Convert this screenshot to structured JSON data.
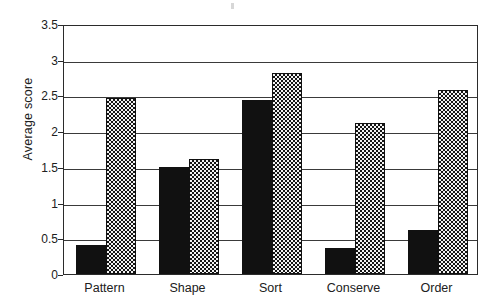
{
  "chart_data": {
    "type": "bar",
    "title": "",
    "xlabel": "",
    "ylabel": "Average score",
    "ylim": [
      0,
      3.5
    ],
    "ytick_values": [
      0,
      0.5,
      1,
      1.5,
      2,
      2.5,
      3,
      3.5
    ],
    "ytick_labels": [
      "0",
      "0.5",
      "1",
      "1.5",
      "2",
      "2.5",
      "3",
      "3.5"
    ],
    "grid": true,
    "grid_axis": "y",
    "legend": "none",
    "categories": [
      "Pattern",
      "Shape",
      "Sort",
      "Conserve",
      "Order"
    ],
    "series": [
      {
        "name": "Series 1",
        "fill": "solid-black",
        "color": "#111111",
        "values": [
          0.4,
          1.5,
          2.43,
          0.37,
          0.62
        ]
      },
      {
        "name": "Series 2",
        "fill": "checkered",
        "color": "#f2f2f2",
        "values": [
          2.47,
          1.61,
          2.82,
          2.12,
          2.57
        ]
      }
    ]
  },
  "axis": {
    "y_title": "Average score"
  },
  "artifact": {
    "name": "scan-speck"
  }
}
